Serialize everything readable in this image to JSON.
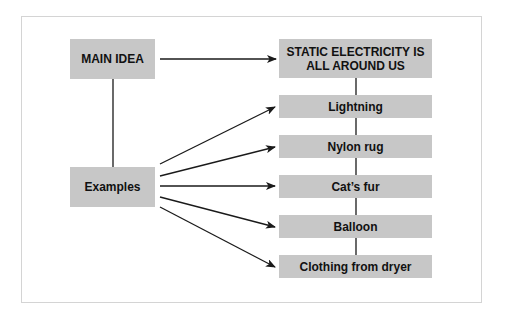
{
  "diagram": {
    "main_idea_label": "MAIN IDEA",
    "main_idea_text": "STATIC ELECTRICITY IS ALL AROUND US",
    "main_idea_line1": "STATIC ELECTRICITY IS",
    "main_idea_line2": "ALL AROUND US",
    "examples_label": "Examples",
    "examples": [
      {
        "label": "Lightning"
      },
      {
        "label": "Nylon rug"
      },
      {
        "label": "Cat’s fur"
      },
      {
        "label": "Balloon"
      },
      {
        "label": "Clothing from dryer"
      }
    ],
    "colors": {
      "box_fill": "#c7c7c7",
      "line": "#1a1a1a",
      "frame_border": "#d4d4d4"
    }
  }
}
